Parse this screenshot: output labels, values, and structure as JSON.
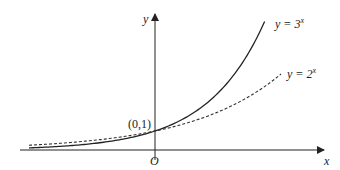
{
  "figure": {
    "axes": {
      "x_label": "x",
      "y_label": "y",
      "origin_label": "O"
    },
    "point_label": "(0,1)",
    "curves": [
      {
        "name": "y = 3^x",
        "base": 3,
        "label_prefix": "y = 3",
        "label_exp": "x",
        "style": "solid",
        "color": "#222222"
      },
      {
        "name": "y = 2^x",
        "base": 2,
        "label_prefix": "y = 2",
        "label_exp": "x",
        "style": "dashed",
        "color": "#333333"
      }
    ]
  },
  "chart_data": {
    "type": "line",
    "title": "",
    "xlabel": "x",
    "ylabel": "y",
    "series": [
      {
        "name": "y = 3^x",
        "style": "solid",
        "x": [
          -2,
          -1.5,
          -1,
          -0.5,
          0,
          0.5,
          1,
          1.5,
          1.74
        ],
        "values": [
          0.11,
          0.19,
          0.33,
          0.58,
          1,
          1.73,
          3,
          5.2,
          6.8
        ]
      },
      {
        "name": "y = 2^x",
        "style": "dashed",
        "x": [
          -2,
          -1.5,
          -1,
          -0.5,
          0,
          0.5,
          1,
          1.5,
          2.0
        ],
        "values": [
          0.25,
          0.35,
          0.5,
          0.71,
          1,
          1.41,
          2,
          2.83,
          4
        ]
      }
    ],
    "annotations": [
      {
        "text": "(0,1)",
        "x": 0,
        "y": 1
      },
      {
        "text": "O",
        "x": 0,
        "y": 0
      }
    ],
    "xlim": [
      -2.1,
      2.7
    ],
    "ylim": [
      0,
      7.2
    ],
    "grid": false,
    "legend": "inline labels at curve ends"
  }
}
